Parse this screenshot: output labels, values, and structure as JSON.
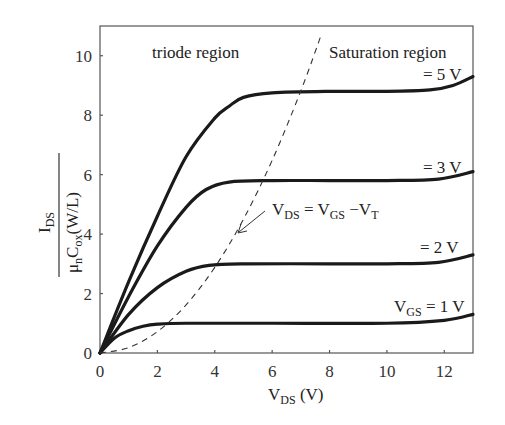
{
  "chart_data": {
    "type": "line",
    "title": "",
    "xlabel": "V_DS (V)",
    "ylabel": "I_DS / (μ_n C_ox (W/L))",
    "xlim": [
      0,
      13
    ],
    "ylim": [
      0,
      11
    ],
    "xticks": [
      0,
      2,
      4,
      6,
      8,
      10,
      12
    ],
    "yticks": [
      0,
      2,
      4,
      6,
      8,
      10
    ],
    "grid": false,
    "legend": "none (inline labels)",
    "series": [
      {
        "name": "V_GS = 5 V",
        "label": "= 5 V",
        "style": "solid",
        "x": [
          0,
          1,
          2,
          3,
          4,
          4.5,
          5,
          6,
          8,
          10,
          11.5,
          12.3,
          13
        ],
        "y": [
          0,
          2.4,
          4.6,
          6.6,
          7.9,
          8.3,
          8.6,
          8.75,
          8.8,
          8.8,
          8.85,
          9.0,
          9.3
        ]
      },
      {
        "name": "V_GS = 3 V",
        "label": "= 3 V",
        "style": "solid",
        "x": [
          0,
          1,
          2,
          3,
          3.7,
          4.5,
          6,
          8,
          10,
          11.8,
          13
        ],
        "y": [
          0,
          1.9,
          3.6,
          4.9,
          5.5,
          5.75,
          5.8,
          5.8,
          5.8,
          5.85,
          6.1
        ]
      },
      {
        "name": "V_GS = 2 V",
        "label": "= 2 V",
        "style": "solid",
        "x": [
          0,
          1,
          2,
          3,
          3.8,
          5,
          8,
          10,
          11.8,
          13
        ],
        "y": [
          0,
          1.3,
          2.2,
          2.75,
          2.95,
          3.0,
          3.0,
          3.0,
          3.05,
          3.3
        ]
      },
      {
        "name": "V_GS = 1 V",
        "label": "V_GS = 1 V",
        "style": "solid",
        "x": [
          0,
          0.5,
          1,
          1.5,
          2,
          3,
          6,
          10,
          12,
          13
        ],
        "y": [
          0,
          0.5,
          0.75,
          0.9,
          0.97,
          1.0,
          1.0,
          1.0,
          1.1,
          1.3
        ]
      },
      {
        "name": "V_DS = V_GS - V_T boundary",
        "style": "dashed",
        "x": [
          0,
          1,
          2,
          3,
          4,
          5,
          6,
          7,
          7.72
        ],
        "y": [
          0,
          0.18,
          0.72,
          1.62,
          2.88,
          4.5,
          6.48,
          8.82,
          10.73
        ]
      }
    ],
    "annotations": [
      {
        "text": "triode region",
        "x": 3.5,
        "y": 10.2
      },
      {
        "text": "Saturation region",
        "x": 10.6,
        "y": 10.2
      },
      {
        "text": "V_DS = V_GS − V_T",
        "x": 6.2,
        "y": 4.5,
        "arrow_to": [
          4.77,
          3.8
        ]
      }
    ]
  },
  "labels": {
    "triode": "triode region",
    "saturation": "Saturation region",
    "vgs5": "= 5 V",
    "vgs3": "= 3 V",
    "vgs2": "= 2 V",
    "vgs1_main": "V",
    "vgs1_sub": "GS",
    "vgs1_rest": " = 1 V",
    "boundary_v1": "V",
    "boundary_s1": "DS",
    "boundary_eq": " = V",
    "boundary_s2": "GS",
    "boundary_minus": " −V",
    "boundary_s3": "T",
    "xlabel_main": "V",
    "xlabel_sub": "DS",
    "xlabel_unit": " (V)",
    "ylabel_num_main": "I",
    "ylabel_num_sub": "DS",
    "ylabel_den_mu": "μ",
    "ylabel_den_n": "n",
    "ylabel_den_c": "C",
    "ylabel_den_ox": "ox",
    "ylabel_den_wl": "(W/L)"
  },
  "colors": {
    "curve": "#1a1a1a",
    "axis": "#555555",
    "background": "#ffffff"
  }
}
